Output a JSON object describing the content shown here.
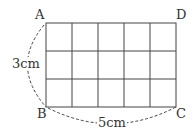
{
  "diagram": {
    "type": "grid-rectangle",
    "rows": 3,
    "cols": 5,
    "vertices": {
      "A": "A",
      "B": "B",
      "C": "C",
      "D": "D"
    },
    "side_labels": {
      "height": "3cm",
      "width": "5cm"
    },
    "colors": {
      "line": "#444444",
      "text": "#333333",
      "background": "#ffffff"
    }
  }
}
